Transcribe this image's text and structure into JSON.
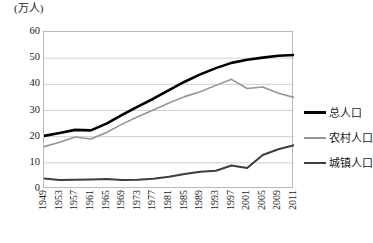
{
  "chart_data": {
    "type": "line",
    "title": "",
    "subtitle": "",
    "ylabel": "(万人)",
    "xlabel": "",
    "ylim": [
      0,
      60
    ],
    "yticks": [
      0,
      10,
      20,
      30,
      40,
      50,
      60
    ],
    "grid": true,
    "legend_position": "right",
    "x": [
      1949,
      1953,
      1957,
      1961,
      1965,
      1969,
      1973,
      1977,
      1981,
      1985,
      1989,
      1993,
      1997,
      2001,
      2005,
      2009,
      2011
    ],
    "xtick_labels": [
      "1949",
      "1953",
      "1957",
      "1961",
      "1965",
      "1969",
      "1973",
      "1977",
      "1981",
      "1985",
      "1989",
      "1993",
      "1997",
      "2001",
      "2005",
      "2009",
      "2011"
    ],
    "series": [
      {
        "name": "总人口",
        "color": "#000000",
        "width": 2.6,
        "values": [
          20.3,
          21.4,
          22.6,
          22.4,
          25.0,
          28.3,
          31.5,
          34.5,
          37.8,
          41.0,
          43.8,
          46.2,
          48.2,
          49.4,
          50.2,
          50.9,
          51.2
        ]
      },
      {
        "name": "农村人口",
        "color": "#959595",
        "width": 1.6,
        "values": [
          16.2,
          17.9,
          19.9,
          19.1,
          21.6,
          24.8,
          27.6,
          30.2,
          32.9,
          35.3,
          37.2,
          39.6,
          41.9,
          38.4,
          39.0,
          36.6,
          35.0
        ]
      },
      {
        "name": "城镇人口",
        "color": "#3d3d3d",
        "width": 2.0,
        "values": [
          4.0,
          3.4,
          3.5,
          3.6,
          3.8,
          3.4,
          3.5,
          3.9,
          4.7,
          5.7,
          6.6,
          7.0,
          9.0,
          8.0,
          13.0,
          15.2,
          16.7
        ]
      }
    ]
  },
  "legend": {
    "items": [
      {
        "label": "总人口",
        "color": "#000000",
        "thickness": "3px"
      },
      {
        "label": "农村人口",
        "color": "#959595",
        "thickness": "2px"
      },
      {
        "label": "城镇人口",
        "color": "#3d3d3d",
        "thickness": "2.5px"
      }
    ]
  }
}
